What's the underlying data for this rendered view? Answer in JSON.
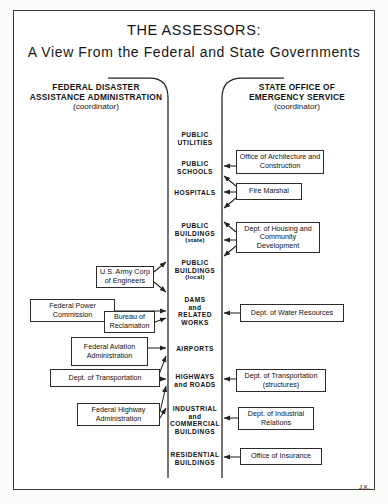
{
  "title": {
    "main": "THE ASSESSORS:",
    "sub": "A View From the Federal and State Governments"
  },
  "signature": "J.K.",
  "columns": {
    "left": {
      "name": "FEDERAL DISASTER ASSISTANCE ADMINISTRATION",
      "line1": "FEDERAL DISASTER",
      "line2": "ASSISTANCE ADMINISTRATION",
      "role": "(coordinator)"
    },
    "right": {
      "name": "STATE OFFICE OF EMERGENCY SERVICE",
      "line1": "STATE OFFICE OF",
      "line2": "EMERGENCY SERVICE",
      "role": "(coordinator)"
    }
  },
  "categories": [
    {
      "line1": "PUBLIC",
      "line2": "UTILITIES",
      "line3": "",
      "sub": ""
    },
    {
      "line1": "PUBLIC",
      "line2": "SCHOOLS",
      "line3": "",
      "sub": ""
    },
    {
      "line1": "HOSPITALS",
      "line2": "",
      "line3": "",
      "sub": ""
    },
    {
      "line1": "PUBLIC",
      "line2": "BUILDINGS",
      "line3": "",
      "sub": "(state)"
    },
    {
      "line1": "PUBLIC",
      "line2": "BUILDINGS",
      "line3": "",
      "sub": "(local)"
    },
    {
      "line1": "DAMS",
      "line2": "and",
      "line3": "RELATED",
      "sub": "WORKS"
    },
    {
      "line1": "AIRPORTS",
      "line2": "",
      "line3": "",
      "sub": ""
    },
    {
      "line1": "HIGHWAYS",
      "line2": "and ROADS",
      "line3": "",
      "sub": ""
    },
    {
      "line1": "INDUSTRIAL",
      "line2": "and",
      "line3": "COMMERCIAL",
      "sub": "BUILDINGS"
    },
    {
      "line1": "RESIDENTIAL",
      "line2": "BUILDINGS",
      "line3": "",
      "sub": ""
    }
  ],
  "federal_agencies": [
    {
      "label": "U.S. Army Corp of Engineers"
    },
    {
      "label": "Federal Power Commission"
    },
    {
      "label": "Bureau of Reclamation"
    },
    {
      "label": "Federal Aviation Administration"
    },
    {
      "label": "Dept. of Transportation"
    },
    {
      "label": "Federal Highway Administration"
    }
  ],
  "state_agencies": [
    {
      "label": "Office of Architecture and Construction"
    },
    {
      "label": "Fire Marshal"
    },
    {
      "label": "Dept. of Housing and Community Development"
    },
    {
      "label": "Dept. of Water Resources"
    },
    {
      "label": "Dept. of Transportation (structures)"
    },
    {
      "label": "Dept. of Industrial Relations"
    },
    {
      "label": "Office of Insurance"
    }
  ],
  "colors": {
    "ink": "#1a1a1a",
    "rule": "#2b2b2b",
    "paper": "#ffffff"
  }
}
